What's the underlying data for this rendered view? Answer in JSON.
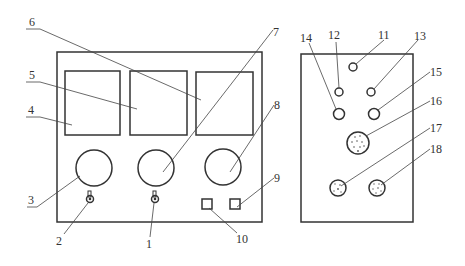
{
  "diagram": {
    "type": "technical-line-drawing",
    "stroke_color": "#333333",
    "background": "#ffffff",
    "front_panel": {
      "displays": [
        {
          "id": "4",
          "label": "4"
        },
        {
          "id": "5",
          "label": "5"
        },
        {
          "id": "6",
          "label": "6"
        }
      ],
      "dials": [
        {
          "id": "3",
          "label": "3"
        },
        {
          "id": "7",
          "label": "7"
        },
        {
          "id": "8",
          "label": "8"
        }
      ],
      "knobs": [
        {
          "id": "2",
          "label": "2"
        },
        {
          "id": "1",
          "label": "1"
        }
      ],
      "buttons": [
        {
          "id": "10",
          "label": "10"
        },
        {
          "id": "9",
          "label": "9"
        }
      ]
    },
    "rear_panel": {
      "small_holes": [
        {
          "id": "11",
          "label": "11"
        },
        {
          "id": "12",
          "label": "12"
        },
        {
          "id": "13",
          "label": "13"
        }
      ],
      "medium_holes": [
        {
          "id": "14",
          "label": "14"
        },
        {
          "id": "15",
          "label": "15"
        }
      ],
      "connectors": [
        {
          "id": "16",
          "label": "16"
        },
        {
          "id": "17",
          "label": "17"
        },
        {
          "id": "18",
          "label": "18"
        }
      ]
    }
  }
}
